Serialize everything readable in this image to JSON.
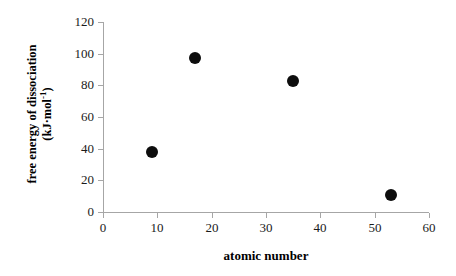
{
  "chart_data": {
    "type": "scatter",
    "title": "",
    "xlabel": "atomic number",
    "ylabel_line1": "free energy of dissociation",
    "ylabel_line2_prefix": "(kJ",
    "ylabel_line2_middot": "·",
    "ylabel_line2_mid": "mol",
    "ylabel_line2_sup": "-1",
    "ylabel_line2_suffix": ")",
    "ylabel_plain": "free energy of dissociation (kJ·mol⁻¹)",
    "xlim": [
      0,
      60
    ],
    "ylim": [
      0,
      120
    ],
    "xticks": [
      0,
      10,
      20,
      30,
      40,
      50,
      60
    ],
    "yticks": [
      0,
      20,
      40,
      60,
      80,
      100,
      120
    ],
    "xtick_labels": [
      "0",
      "10",
      "20",
      "30",
      "40",
      "50",
      "60"
    ],
    "ytick_labels": [
      "0",
      "20",
      "40",
      "60",
      "80",
      "100",
      "120"
    ],
    "grid": false,
    "legend": false,
    "marker": "filled-circle",
    "marker_color": "#0d0d0d",
    "axis_color": "#a6a6a6",
    "x": [
      9,
      17,
      35,
      53
    ],
    "y": [
      38,
      97,
      83,
      11
    ],
    "points": [
      {
        "x": 9,
        "y": 38
      },
      {
        "x": 17,
        "y": 97
      },
      {
        "x": 35,
        "y": 83
      },
      {
        "x": 53,
        "y": 11
      }
    ]
  }
}
